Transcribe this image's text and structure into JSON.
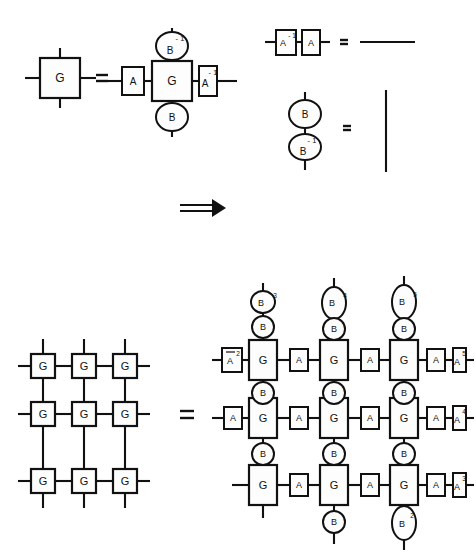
{
  "figure": {
    "symbols": {
      "equals": "=",
      "implies": "⇒",
      "G": "G",
      "A": "A",
      "B": "B"
    },
    "panel_top_left": {
      "name": "single-gate-identity",
      "lhs": {
        "node": "G"
      },
      "relation": "=",
      "rhs": {
        "left_box": "A",
        "center_box": "G",
        "right_box": "A",
        "right_box_sup": "- 1",
        "top_ellipse": "B",
        "top_ellipse_sup": "- 1",
        "bottom_ellipse": "B"
      }
    },
    "panel_top_right_a": {
      "name": "a-inverse-identity",
      "left_box": "A",
      "left_box_sup": "- 1",
      "right_box": "A",
      "relation": "=",
      "rhs_label": "identity-wire-horizontal"
    },
    "panel_top_right_b": {
      "name": "b-inverse-identity",
      "top_ellipse": "B",
      "bottom_ellipse": "B",
      "bottom_ellipse_sup": "- 1",
      "relation": "=",
      "rhs_label": "identity-wire-vertical"
    },
    "implication_arrow": {
      "name": "implies-arrow",
      "glyph": "⇒"
    },
    "panel_bottom_left": {
      "name": "plain-3x3-grid",
      "rows": 3,
      "cols": 3,
      "cell_label": "G",
      "cells": [
        [
          "G",
          "G",
          "G"
        ],
        [
          "G",
          "G",
          "G"
        ],
        [
          "G",
          "G",
          "G"
        ]
      ]
    },
    "panel_bottom_relation": "=",
    "panel_bottom_right": {
      "name": "gauged-3x3-grid",
      "rows": 3,
      "cols": 3,
      "cell_label": "G",
      "horizontal_link_label": "A",
      "vertical_link_label": "B",
      "row_left_caps": [
        {
          "label": "A",
          "sup": "2"
        },
        {
          "label": "A",
          "sup": ""
        },
        {
          "label": "",
          "sup": ""
        }
      ],
      "row_right_caps": [
        {
          "label": "A",
          "sup": "5"
        },
        {
          "label": "A",
          "sup": "4"
        },
        {
          "label": "A",
          "sup": "3"
        }
      ],
      "col_top_caps": [
        {
          "label": "B",
          "sup": "3"
        },
        {
          "label": "B",
          "sup": "4"
        },
        {
          "label": "B",
          "sup": "5"
        }
      ],
      "col_bottom_caps": [
        {
          "label": "",
          "sup": ""
        },
        {
          "label": "B",
          "sup": ""
        },
        {
          "label": "B",
          "sup": "2"
        }
      ]
    }
  }
}
